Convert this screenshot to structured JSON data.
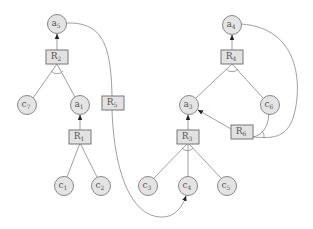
{
  "diagram": {
    "nodes": [
      {
        "id": "a5",
        "label": "a",
        "sub": "5",
        "x": 57,
        "y": 24
      },
      {
        "id": "c7",
        "label": "c",
        "sub": "7",
        "x": 27,
        "y": 105
      },
      {
        "id": "a1",
        "label": "a",
        "sub": "1",
        "x": 80,
        "y": 105
      },
      {
        "id": "c1",
        "label": "c",
        "sub": "1",
        "x": 64,
        "y": 186
      },
      {
        "id": "c2",
        "label": "c",
        "sub": "2",
        "x": 101,
        "y": 186
      },
      {
        "id": "a4",
        "label": "a",
        "sub": "4",
        "x": 232,
        "y": 25
      },
      {
        "id": "a3",
        "label": "a",
        "sub": "3",
        "x": 189,
        "y": 105
      },
      {
        "id": "c6",
        "label": "c",
        "sub": "6",
        "x": 270,
        "y": 105
      },
      {
        "id": "c3",
        "label": "c",
        "sub": "3",
        "x": 148,
        "y": 186
      },
      {
        "id": "c4",
        "label": "c",
        "sub": "4",
        "x": 188,
        "y": 186
      },
      {
        "id": "c5",
        "label": "c",
        "sub": "5",
        "x": 227,
        "y": 186
      }
    ],
    "rules": [
      {
        "id": "R2",
        "label": "R",
        "sub": "2",
        "x": 57,
        "y": 57
      },
      {
        "id": "R1",
        "label": "R",
        "sub": "1",
        "x": 80,
        "y": 137
      },
      {
        "id": "R5",
        "label": "R",
        "sub": "5",
        "x": 113,
        "y": 103
      },
      {
        "id": "R4",
        "label": "R",
        "sub": "4",
        "x": 232,
        "y": 57
      },
      {
        "id": "R3",
        "label": "R",
        "sub": "3",
        "x": 188,
        "y": 137
      },
      {
        "id": "R6",
        "label": "R",
        "sub": "6",
        "x": 242,
        "y": 132
      }
    ],
    "edges": [
      {
        "from": "R2",
        "to": "a5",
        "arrow": true
      },
      {
        "from": "c7",
        "to": "R2"
      },
      {
        "from": "a1",
        "to": "R2"
      },
      {
        "from": "R1",
        "to": "a1",
        "arrow": true
      },
      {
        "from": "c1",
        "to": "R1"
      },
      {
        "from": "c2",
        "to": "R1"
      },
      {
        "from": "a5",
        "to": "R5",
        "curve": true
      },
      {
        "from": "R5",
        "to": "c4",
        "arrow": true,
        "curve": true
      },
      {
        "from": "R4",
        "to": "a4",
        "arrow": true
      },
      {
        "from": "a3",
        "to": "R4"
      },
      {
        "from": "c6",
        "to": "R4"
      },
      {
        "from": "R3",
        "to": "a3",
        "arrow": true
      },
      {
        "from": "c3",
        "to": "R3"
      },
      {
        "from": "c4",
        "to": "R3"
      },
      {
        "from": "c5",
        "to": "R3"
      },
      {
        "from": "R6",
        "to": "a3",
        "arrow": true
      },
      {
        "from": "c6",
        "to": "R6"
      },
      {
        "from": "a4",
        "to": "R6",
        "curve": true
      }
    ]
  }
}
